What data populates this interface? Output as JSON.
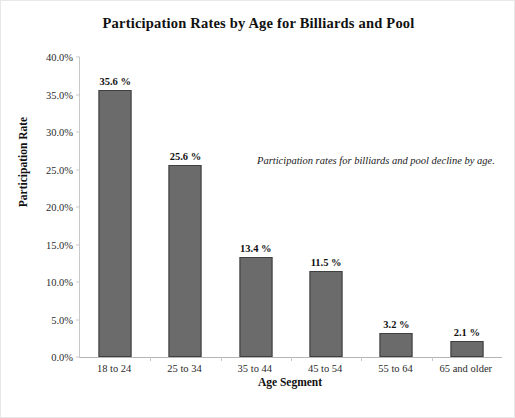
{
  "chart_data": {
    "type": "bar",
    "title": "Participation Rates by Age for Billiards and Pool",
    "xlabel": "Age Segment",
    "ylabel": "Participation Rate",
    "categories": [
      "18 to 24",
      "25 to 34",
      "35 to 44",
      "45 to 54",
      "55 to 64",
      "65 and older"
    ],
    "values": [
      35.6,
      25.6,
      13.4,
      11.5,
      3.2,
      2.1
    ],
    "data_labels": [
      "35.6 %",
      "25.6 %",
      "13.4 %",
      "11.5 %",
      "3.2 %",
      "2.1 %"
    ],
    "ylim": [
      0,
      40
    ],
    "ytick_step": 5,
    "ytick_labels": [
      "0.0%",
      "5.0%",
      "10.0%",
      "15.0%",
      "20.0%",
      "25.0%",
      "30.0%",
      "35.0%",
      "40.0%"
    ],
    "ytick_values": [
      0,
      5,
      10,
      15,
      20,
      25,
      30,
      35,
      40
    ],
    "grid": false,
    "legend": "none",
    "annotations": [
      {
        "text": "Participation rates for billiards and pool decline by age.",
        "style": "italic"
      }
    ],
    "colors": {
      "bar_fill": "#6b6b6b",
      "bar_edge": "#3f3f3f",
      "axis": "#c9c9c9",
      "text": "#111111",
      "background": "#ffffff"
    }
  }
}
